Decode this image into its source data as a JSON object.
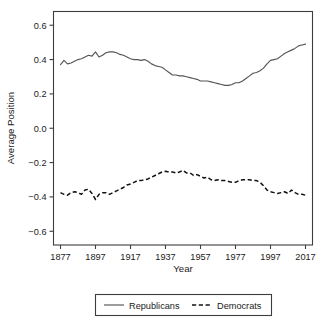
{
  "chart_data": {
    "type": "line",
    "title": "",
    "xlabel": "Year",
    "ylabel": "Average Position",
    "xlim": [
      1873,
      2021
    ],
    "ylim": [
      -0.68,
      0.68
    ],
    "xticks": [
      1877,
      1897,
      1917,
      1937,
      1957,
      1977,
      1997,
      2017
    ],
    "yticks": [
      0.6,
      0.4,
      0.2,
      0.0,
      -0.2,
      -0.4,
      -0.6
    ],
    "ytick_labels": [
      "0.6",
      "0.4",
      "0.2",
      "0.0",
      "-0.2",
      "-0.4",
      "-0.6"
    ],
    "grid": false,
    "legend_position": "bottom",
    "x": [
      1877,
      1879,
      1881,
      1883,
      1885,
      1887,
      1889,
      1891,
      1893,
      1895,
      1897,
      1899,
      1901,
      1903,
      1905,
      1907,
      1909,
      1911,
      1913,
      1915,
      1917,
      1919,
      1921,
      1923,
      1925,
      1927,
      1929,
      1931,
      1933,
      1935,
      1937,
      1939,
      1941,
      1943,
      1945,
      1947,
      1949,
      1951,
      1953,
      1955,
      1957,
      1959,
      1961,
      1963,
      1965,
      1967,
      1969,
      1971,
      1973,
      1975,
      1977,
      1979,
      1981,
      1983,
      1985,
      1987,
      1989,
      1991,
      1993,
      1995,
      1997,
      1999,
      2001,
      2003,
      2005,
      2007,
      2009,
      2011,
      2013,
      2015,
      2017
    ],
    "series": [
      {
        "name": "Republicans",
        "style": "solid",
        "color": "#555555",
        "values": [
          0.37,
          0.395,
          0.375,
          0.38,
          0.39,
          0.4,
          0.405,
          0.415,
          0.425,
          0.42,
          0.445,
          0.415,
          0.425,
          0.44,
          0.445,
          0.445,
          0.44,
          0.43,
          0.425,
          0.415,
          0.405,
          0.4,
          0.4,
          0.395,
          0.4,
          0.39,
          0.375,
          0.365,
          0.36,
          0.355,
          0.34,
          0.325,
          0.31,
          0.31,
          0.305,
          0.305,
          0.3,
          0.295,
          0.29,
          0.285,
          0.275,
          0.275,
          0.275,
          0.27,
          0.265,
          0.26,
          0.255,
          0.25,
          0.25,
          0.255,
          0.265,
          0.265,
          0.275,
          0.29,
          0.305,
          0.32,
          0.325,
          0.335,
          0.35,
          0.375,
          0.395,
          0.4,
          0.405,
          0.42,
          0.435,
          0.445,
          0.455,
          0.465,
          0.48,
          0.485,
          0.49
        ]
      },
      {
        "name": "Democrats",
        "style": "dashed",
        "color": "#121212",
        "values": [
          -0.375,
          -0.385,
          -0.39,
          -0.375,
          -0.37,
          -0.375,
          -0.385,
          -0.36,
          -0.355,
          -0.38,
          -0.415,
          -0.385,
          -0.375,
          -0.375,
          -0.385,
          -0.375,
          -0.365,
          -0.355,
          -0.345,
          -0.33,
          -0.325,
          -0.315,
          -0.305,
          -0.305,
          -0.3,
          -0.295,
          -0.285,
          -0.275,
          -0.265,
          -0.255,
          -0.25,
          -0.255,
          -0.255,
          -0.26,
          -0.255,
          -0.245,
          -0.26,
          -0.26,
          -0.275,
          -0.27,
          -0.28,
          -0.29,
          -0.285,
          -0.3,
          -0.305,
          -0.3,
          -0.305,
          -0.305,
          -0.31,
          -0.315,
          -0.315,
          -0.305,
          -0.3,
          -0.3,
          -0.3,
          -0.305,
          -0.305,
          -0.315,
          -0.335,
          -0.36,
          -0.37,
          -0.375,
          -0.38,
          -0.375,
          -0.37,
          -0.38,
          -0.36,
          -0.375,
          -0.385,
          -0.385,
          -0.39
        ]
      }
    ]
  },
  "legend": {
    "entries": [
      {
        "label": "Republicans"
      },
      {
        "label": "Democrats"
      }
    ]
  }
}
